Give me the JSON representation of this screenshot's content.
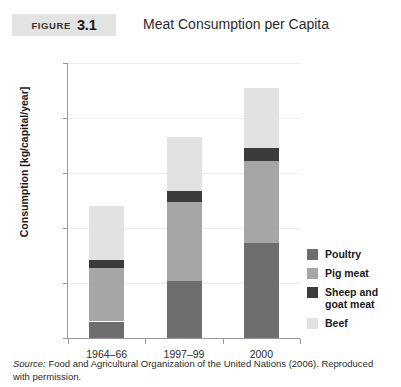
{
  "header": {
    "badge_word": "FIGURE",
    "badge_number": "3.1",
    "title": "Meat Consumption per Capita"
  },
  "footer": {
    "source_label": "Source:",
    "source_text": " Food and Agricultural Organization of the United Nations (2006). Reproduced with permission."
  },
  "colors": {
    "poultry": "#6e6e6e",
    "pig_meat": "#a6a6a6",
    "sheep_and_goat_meat": "#3b3b3b",
    "beef": "#e2e2e2",
    "axis": "#9a9a9a",
    "grid": "#ececec",
    "badge_background": "#e3e3e3"
  },
  "chart_data": {
    "type": "bar",
    "stacked": true,
    "title": "Meat Consumption per Capita",
    "xlabel": "",
    "ylabel": "Consumption [kg/capital/year]",
    "categories": [
      "1964–66",
      "1997–99",
      "2000"
    ],
    "ylim": [
      0,
      50
    ],
    "yticks": [
      0,
      10,
      20,
      30,
      40,
      50
    ],
    "ytick_labels": [
      "0",
      "10",
      "20",
      "30",
      "40",
      "50"
    ],
    "grid": true,
    "legend_position": "right",
    "series": [
      {
        "name": "Poultry",
        "color": "#6e6e6e",
        "values": [
          3.0,
          10.4,
          17.3
        ]
      },
      {
        "name": "Pig meat",
        "color": "#a6a6a6",
        "values": [
          9.8,
          14.4,
          14.9
        ]
      },
      {
        "name": "Sheep and goat meat",
        "color": "#3b3b3b",
        "values": [
          1.4,
          2.0,
          2.3
        ]
      },
      {
        "name": "Beef",
        "color": "#e2e2e2",
        "values": [
          9.8,
          9.7,
          11.0
        ]
      }
    ],
    "totals": [
      24.0,
      36.5,
      45.5
    ]
  },
  "legend": {
    "items": [
      {
        "label": "Poultry",
        "color": "#6e6e6e"
      },
      {
        "label": "Pig meat",
        "color": "#a6a6a6"
      },
      {
        "label": "Sheep and\ngoat meat",
        "color": "#3b3b3b"
      },
      {
        "label": "Beef",
        "color": "#e2e2e2"
      }
    ]
  }
}
